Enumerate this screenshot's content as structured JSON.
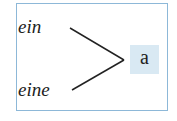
{
  "diagram": {
    "sources": [
      {
        "label": "ein"
      },
      {
        "label": "eine"
      }
    ],
    "target": {
      "label": "a"
    },
    "colors": {
      "frame_border": "#8db8d8",
      "target_bg": "#d9e9f3",
      "line": "#222222"
    }
  }
}
